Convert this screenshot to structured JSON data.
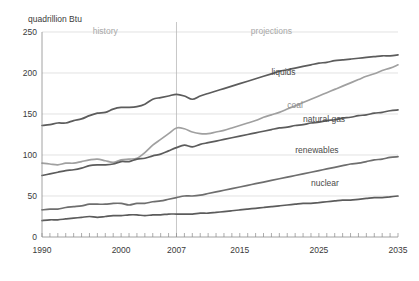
{
  "chart_data": {
    "type": "line",
    "title": "",
    "subtitle": "",
    "xlabel": "",
    "ylabel": "quadrillion Btu",
    "ylim": [
      0,
      250
    ],
    "xlim": [
      1990,
      2035
    ],
    "grid": true,
    "legend_position": "inline-right",
    "yticks": [
      "0",
      "50",
      "100",
      "150",
      "200",
      "250"
    ],
    "ytick_values": [
      0,
      50,
      100,
      150,
      200,
      250
    ],
    "xticks": [
      "1990",
      "2000",
      "2007",
      "2015",
      "2025",
      "2035"
    ],
    "xtick_values": [
      1990,
      2000,
      2007,
      2015,
      2025,
      2035
    ],
    "annotations": [
      {
        "text": "history",
        "x": 1998,
        "y": 248
      },
      {
        "text": "projections",
        "x": 2019,
        "y": 248
      }
    ],
    "divider_x": 2007,
    "x": [
      1990,
      1991,
      1992,
      1993,
      1994,
      1995,
      1996,
      1997,
      1998,
      1999,
      2000,
      2001,
      2002,
      2003,
      2004,
      2005,
      2006,
      2007,
      2008,
      2009,
      2010,
      2011,
      2012,
      2013,
      2014,
      2015,
      2016,
      2017,
      2018,
      2019,
      2020,
      2021,
      2022,
      2023,
      2024,
      2025,
      2026,
      2027,
      2028,
      2029,
      2030,
      2031,
      2032,
      2033,
      2034,
      2035
    ],
    "series": [
      {
        "name": "liquids",
        "color": "#5c5c5c",
        "label_x": 2019,
        "label_y": 197,
        "values": [
          136,
          137,
          139,
          139,
          142,
          144,
          148,
          151,
          152,
          156,
          158,
          158,
          159,
          162,
          168,
          170,
          172,
          174,
          172,
          168,
          172,
          175,
          178,
          181,
          184,
          187,
          190,
          193,
          196,
          199,
          202,
          204,
          206,
          208,
          210,
          212,
          213,
          215,
          216,
          217,
          218,
          219,
          220,
          221,
          221,
          222
        ]
      },
      {
        "name": "coal",
        "color": "#a0a0a0",
        "label_x": 2021,
        "label_y": 157,
        "values": [
          90,
          89,
          88,
          90,
          90,
          92,
          94,
          95,
          93,
          91,
          94,
          95,
          96,
          103,
          112,
          119,
          126,
          133,
          132,
          128,
          126,
          126,
          128,
          130,
          133,
          136,
          139,
          142,
          146,
          149,
          152,
          156,
          160,
          164,
          168,
          172,
          176,
          180,
          184,
          188,
          192,
          196,
          199,
          203,
          206,
          210
        ]
      },
      {
        "name": "natural gas",
        "color": "#5c5c5c",
        "label_x": 2023,
        "label_y": 140,
        "values": [
          75,
          77,
          79,
          81,
          82,
          84,
          87,
          88,
          88,
          89,
          92,
          92,
          95,
          96,
          99,
          101,
          105,
          109,
          112,
          110,
          113,
          115,
          117,
          119,
          121,
          123,
          125,
          127,
          129,
          131,
          133,
          134,
          136,
          137,
          139,
          140,
          142,
          143,
          145,
          146,
          148,
          149,
          151,
          152,
          154,
          155
        ]
      },
      {
        "name": "renewables",
        "color": "#6e6e6e",
        "label_x": 2022,
        "label_y": 103,
        "values": [
          33,
          34,
          34,
          36,
          37,
          38,
          40,
          40,
          40,
          41,
          41,
          39,
          41,
          41,
          43,
          44,
          46,
          48,
          50,
          50,
          51,
          53,
          55,
          57,
          59,
          61,
          63,
          65,
          67,
          69,
          71,
          73,
          75,
          77,
          79,
          81,
          83,
          85,
          87,
          89,
          90,
          92,
          94,
          95,
          97,
          98
        ]
      },
      {
        "name": "nuclear",
        "color": "#5c5c5c",
        "label_x": 2024,
        "label_y": 62,
        "values": [
          20,
          21,
          21,
          22,
          23,
          24,
          25,
          24,
          25,
          26,
          26,
          27,
          27,
          26,
          27,
          27,
          28,
          28,
          28,
          28,
          29,
          29,
          30,
          31,
          32,
          33,
          34,
          35,
          36,
          37,
          38,
          39,
          40,
          41,
          41,
          42,
          43,
          44,
          45,
          45,
          46,
          47,
          48,
          48,
          49,
          50
        ]
      }
    ]
  }
}
